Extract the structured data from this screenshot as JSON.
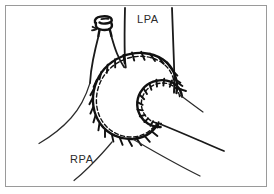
{
  "figure": {
    "domain_kind": "anatomical-line-diagram",
    "title_text": "",
    "frame": {
      "border_color": "#9a9a9a",
      "background_color": "#ffffff",
      "inset_px": 5,
      "border_width_px": 1
    },
    "ink_color": "#111111",
    "thin_ink_color": "#2b2b2b",
    "labels": [
      {
        "id": "lpa",
        "text": "LPA",
        "x": 137,
        "y": 13,
        "meaning": "left pulmonary artery"
      },
      {
        "id": "rpa",
        "text": "RPA",
        "x": 70,
        "y": 153,
        "meaning": "right pulmonary artery"
      }
    ],
    "structures": [
      {
        "id": "oversewn-stump",
        "label": "oversewn-stump",
        "description": "small ligated vessel stump at upper left"
      },
      {
        "id": "outer-suture-arc",
        "label": "outer-suture-arc",
        "description": "large spiral suture line with tick stitches"
      },
      {
        "id": "inner-suture-arc",
        "label": "inner-suture-arc",
        "description": "inner spiral suture line with tick stitches"
      },
      {
        "id": "lpa-trunk",
        "label": "lpa-trunk",
        "description": "left pulmonary artery vessel walls descending from top"
      },
      {
        "id": "rpa-trunk",
        "label": "rpa-trunk",
        "description": "right pulmonary artery vessel walls to lower left"
      },
      {
        "id": "distal-branches",
        "label": "distal-branches",
        "description": "two vessel lines extending to lower right"
      }
    ]
  }
}
